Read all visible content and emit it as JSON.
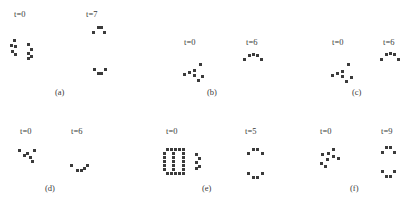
{
  "figure": {
    "dot_color": "#3b3b3b",
    "background_color": "#ffffff",
    "panels": [
      {
        "id": "a",
        "caption": "(a)",
        "caption_x": 55,
        "caption_y": 88,
        "states": [
          {
            "name": "initial",
            "time_label": "t=0",
            "label_x": 14,
            "label_y": 10,
            "origin_x": 10,
            "origin_y": 39,
            "dots": [
              [
                3,
                0
              ],
              [
                0,
                5
              ],
              [
                4,
                6
              ],
              [
                1,
                11
              ],
              [
                4,
                14
              ],
              [
                17,
                4
              ],
              [
                20,
                9
              ],
              [
                17,
                13
              ],
              [
                20,
                16
              ],
              [
                17,
                18
              ]
            ]
          },
          {
            "name": "final",
            "time_label": "t=7",
            "label_x": 86,
            "label_y": 10,
            "origin_x": 88,
            "origin_y": 26,
            "dots": [
              [
                9,
                0
              ],
              [
                12,
                0
              ],
              [
                4,
                5
              ],
              [
                15,
                5
              ],
              [
                5,
                42
              ],
              [
                16,
                42
              ],
              [
                9,
                46
              ],
              [
                12,
                46
              ]
            ]
          }
        ]
      },
      {
        "id": "b",
        "caption": "(b)",
        "caption_x": 207,
        "caption_y": 88,
        "states": [
          {
            "name": "initial",
            "time_label": "t=0",
            "label_x": 184,
            "label_y": 38,
            "origin_x": 183,
            "origin_y": 63,
            "dots": [
              [
                16,
                0
              ],
              [
                0,
                10
              ],
              [
                5,
                8
              ],
              [
                10,
                6
              ],
              [
                10,
                11
              ],
              [
                18,
                12
              ],
              [
                14,
                16
              ]
            ]
          },
          {
            "name": "final",
            "time_label": "t=6",
            "label_x": 246,
            "label_y": 38,
            "origin_x": 243,
            "origin_y": 52,
            "dots": [
              [
                0,
                6
              ],
              [
                5,
                2
              ],
              [
                9,
                1
              ],
              [
                13,
                2
              ],
              [
                17,
                6
              ]
            ]
          }
        ]
      },
      {
        "id": "c",
        "caption": "(c)",
        "caption_x": 352,
        "caption_y": 88,
        "states": [
          {
            "name": "initial",
            "time_label": "t=0",
            "label_x": 332,
            "label_y": 38,
            "origin_x": 331,
            "origin_y": 63,
            "dots": [
              [
                16,
                0
              ],
              [
                0,
                11
              ],
              [
                5,
                9
              ],
              [
                10,
                7
              ],
              [
                10,
                12
              ],
              [
                19,
                13
              ],
              [
                14,
                17
              ]
            ]
          },
          {
            "name": "final",
            "time_label": "t=6",
            "label_x": 383,
            "label_y": 38,
            "origin_x": 380,
            "origin_y": 51,
            "dots": [
              [
                0,
                7
              ],
              [
                5,
                2
              ],
              [
                9,
                1
              ],
              [
                13,
                2
              ],
              [
                17,
                7
              ]
            ]
          }
        ]
      },
      {
        "id": "d",
        "caption": "(d)",
        "caption_x": 45,
        "caption_y": 184,
        "states": [
          {
            "name": "initial",
            "time_label": "t=0",
            "label_x": 20,
            "label_y": 127,
            "origin_x": 18,
            "origin_y": 149,
            "dots": [
              [
                0,
                0
              ],
              [
                8,
                3
              ],
              [
                15,
                0
              ],
              [
                11,
                7
              ],
              [
                5,
                5
              ],
              [
                13,
                11
              ]
            ]
          },
          {
            "name": "final",
            "time_label": "t=6",
            "label_x": 71,
            "label_y": 127,
            "origin_x": 70,
            "origin_y": 164,
            "dots": [
              [
                0,
                0
              ],
              [
                6,
                5
              ],
              [
                10,
                5
              ],
              [
                16,
                0
              ],
              [
                13,
                3
              ]
            ]
          }
        ]
      },
      {
        "id": "e",
        "caption": "(e)",
        "caption_x": 202,
        "caption_y": 184,
        "states": [
          {
            "name": "initial",
            "time_label": "t=0",
            "label_x": 166,
            "label_y": 127,
            "origin_x": 163,
            "origin_y": 148,
            "dots": [
              [
                3,
                0
              ],
              [
                7,
                0
              ],
              [
                11,
                0
              ],
              [
                15,
                0
              ],
              [
                19,
                0
              ],
              [
                0,
                4
              ],
              [
                9,
                4
              ],
              [
                19,
                4
              ],
              [
                0,
                8
              ],
              [
                9,
                8
              ],
              [
                19,
                8
              ],
              [
                0,
                12
              ],
              [
                9,
                12
              ],
              [
                19,
                12
              ],
              [
                0,
                16
              ],
              [
                9,
                16
              ],
              [
                19,
                16
              ],
              [
                0,
                20
              ],
              [
                9,
                20
              ],
              [
                19,
                20
              ],
              [
                3,
                24
              ],
              [
                7,
                24
              ],
              [
                11,
                24
              ],
              [
                15,
                24
              ],
              [
                19,
                24
              ],
              [
                32,
                5
              ],
              [
                35,
                9
              ],
              [
                32,
                13
              ],
              [
                35,
                17
              ],
              [
                32,
                19
              ]
            ]
          },
          {
            "name": "final",
            "time_label": "t=5",
            "label_x": 245,
            "label_y": 127,
            "origin_x": 243,
            "origin_y": 148,
            "dots": [
              [
                4,
                4
              ],
              [
                9,
                0
              ],
              [
                13,
                0
              ],
              [
                18,
                4
              ],
              [
                4,
                24
              ],
              [
                9,
                28
              ],
              [
                13,
                28
              ],
              [
                18,
                24
              ]
            ]
          }
        ]
      },
      {
        "id": "f",
        "caption": "(f)",
        "caption_x": 350,
        "caption_y": 184,
        "states": [
          {
            "name": "initial",
            "time_label": "t=0",
            "label_x": 320,
            "label_y": 127,
            "origin_x": 316,
            "origin_y": 148,
            "dots": [
              [
                5,
                5
              ],
              [
                16,
                0
              ],
              [
                11,
                4
              ],
              [
                16,
                7
              ],
              [
                10,
                10
              ],
              [
                21,
                9
              ],
              [
                4,
                14
              ],
              [
                8,
                17
              ]
            ]
          },
          {
            "name": "final",
            "time_label": "t=9",
            "label_x": 381,
            "label_y": 127,
            "origin_x": 378,
            "origin_y": 146,
            "dots": [
              [
                7,
                0
              ],
              [
                11,
                0
              ],
              [
                3,
                5
              ],
              [
                15,
                5
              ],
              [
                3,
                24
              ],
              [
                15,
                24
              ],
              [
                7,
                29
              ],
              [
                11,
                29
              ]
            ]
          }
        ]
      }
    ]
  }
}
